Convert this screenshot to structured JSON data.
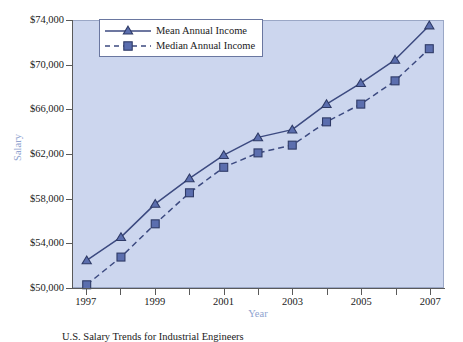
{
  "chart_data": {
    "type": "line",
    "title": "",
    "caption": "U.S. Salary Trends for Industrial Engineers",
    "xlabel": "Year",
    "ylabel": "Salary",
    "x": [
      1997,
      1998,
      1999,
      2000,
      2001,
      2002,
      2003,
      2004,
      2005,
      2006,
      2007
    ],
    "xlim": [
      1996.6,
      2007.4
    ],
    "ylim": [
      50000,
      74000
    ],
    "y_ticks": [
      50000,
      54000,
      58000,
      62000,
      66000,
      70000,
      74000
    ],
    "y_tick_labels": [
      "$50,000",
      "$54,000",
      "$58,000",
      "$62,000",
      "$66,000",
      "$70,000",
      "$74,000"
    ],
    "x_ticks": [
      1997,
      1998,
      1999,
      2000,
      2001,
      2002,
      2003,
      2004,
      2005,
      2006,
      2007
    ],
    "x_tick_labels": [
      "1997",
      "",
      "1999",
      "",
      "2001",
      "",
      "2003",
      "",
      "2005",
      "",
      "2007"
    ],
    "grid": false,
    "legend_position": "top-left",
    "series": [
      {
        "name": "Mean Annual Income",
        "marker": "triangle",
        "linestyle": "solid",
        "color": "#3c4a80",
        "values": [
          52400,
          54500,
          57500,
          59800,
          61900,
          63500,
          64200,
          66500,
          68400,
          70500,
          73600
        ]
      },
      {
        "name": "Median Annual Income",
        "marker": "square",
        "linestyle": "dashed",
        "color": "#3c4a80",
        "values": [
          50200,
          52700,
          55700,
          58500,
          60800,
          62100,
          62800,
          64900,
          66500,
          68600,
          71500
        ]
      }
    ],
    "colors": {
      "plot_background": "#ccd6ee",
      "series_line": "#3c4a80",
      "marker_fill": "#5b6eae",
      "marker_stroke": "#2e3a66",
      "axis": "#5a5a5a",
      "axis_title": "#8fa3cf",
      "tick_label": "#1a1a1a",
      "legend_border": "#6a77a0",
      "page_background": "#ffffff"
    }
  }
}
